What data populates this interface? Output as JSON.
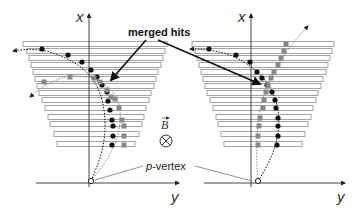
{
  "diagram": {
    "colors": {
      "axis": "#444444",
      "bar_stroke": "#9a9a9a",
      "bar_fill": "#ffffff",
      "hit_black": "#111111",
      "hit_gray": "#888888",
      "arrow": "#111111",
      "leader": "#777777"
    },
    "labels": {
      "merged_hits": "merged hits",
      "p_vertex_italic": "p",
      "p_vertex_rest": "-vertex",
      "b_field": "B",
      "b_field_symbol": "⊗"
    },
    "panels": [
      {
        "name": "left",
        "axis_x_label": "x",
        "axis_y_label": "y",
        "axis_origin": [
          89,
          183
        ],
        "axis_top": 14,
        "axis_right": 179,
        "axis_left": 36,
        "vertex": [
          91,
          181
        ],
        "bars": [
          {
            "y": 44,
            "x1": 23,
            "x2": 167
          },
          {
            "y": 51,
            "x1": 27,
            "x2": 165
          },
          {
            "y": 58,
            "x1": 29,
            "x2": 163
          },
          {
            "y": 65,
            "x1": 31,
            "x2": 161
          },
          {
            "y": 72,
            "x1": 33,
            "x2": 158
          },
          {
            "y": 79,
            "x1": 35,
            "x2": 156
          },
          {
            "y": 86,
            "x1": 37,
            "x2": 154
          },
          {
            "y": 93,
            "x1": 39,
            "x2": 151
          },
          {
            "y": 100,
            "x1": 42,
            "x2": 149
          },
          {
            "y": 108,
            "x1": 45,
            "x2": 146
          },
          {
            "y": 117,
            "x1": 48,
            "x2": 144
          },
          {
            "y": 124,
            "x1": 50,
            "x2": 142
          },
          {
            "y": 134,
            "x1": 54,
            "x2": 139
          },
          {
            "y": 144,
            "x1": 57,
            "x2": 135
          }
        ],
        "tracks": [
          {
            "color": "black",
            "path": "M91,181 C100,160 108,140 104,110 C100,85 90,65 50,52 C40,49 25,49 13,51",
            "hits": [
              [
                42,
                49
              ],
              [
                68,
                55
              ],
              [
                82,
                62
              ],
              [
                91,
                70
              ],
              [
                97,
                77
              ],
              [
                102,
                85
              ],
              [
                107,
                92
              ],
              [
                108,
                101
              ],
              [
                110,
                110
              ],
              [
                112,
                120
              ],
              [
                113,
                126
              ],
              [
                113,
                136
              ],
              [
                112,
                145
              ]
            ]
          },
          {
            "color": "gray",
            "path": "M91,181 C108,160 122,140 120,110 C118,90 100,75 70,76 C50,80 38,90 30,97",
            "hits": [
              [
                44,
                82
              ],
              [
                70,
                77
              ],
              [
                94,
                78
              ],
              [
                100,
                82
              ],
              [
                107,
                90
              ],
              [
                111,
                97
              ],
              [
                115,
                99
              ],
              [
                119,
                108
              ],
              [
                122,
                120
              ],
              [
                124,
                126
              ],
              [
                124,
                136
              ],
              [
                124,
                145
              ]
            ]
          }
        ]
      },
      {
        "name": "right",
        "axis_x_label": "x",
        "axis_y_label": "y",
        "axis_origin": [
          251,
          183
        ],
        "axis_top": 14,
        "axis_right": 345,
        "axis_left": 204,
        "vertex": [
          258,
          181
        ],
        "bars": [
          {
            "y": 44,
            "x1": 192,
            "x2": 334
          },
          {
            "y": 51,
            "x1": 195,
            "x2": 332
          },
          {
            "y": 58,
            "x1": 197,
            "x2": 330
          },
          {
            "y": 65,
            "x1": 199,
            "x2": 328
          },
          {
            "y": 72,
            "x1": 201,
            "x2": 326
          },
          {
            "y": 79,
            "x1": 203,
            "x2": 323
          },
          {
            "y": 86,
            "x1": 205,
            "x2": 321
          },
          {
            "y": 93,
            "x1": 207,
            "x2": 318
          },
          {
            "y": 100,
            "x1": 210,
            "x2": 316
          },
          {
            "y": 108,
            "x1": 213,
            "x2": 313
          },
          {
            "y": 117,
            "x1": 216,
            "x2": 311
          },
          {
            "y": 124,
            "x1": 218,
            "x2": 308
          },
          {
            "y": 134,
            "x1": 221,
            "x2": 305
          },
          {
            "y": 144,
            "x1": 224,
            "x2": 302
          }
        ],
        "tracks": [
          {
            "color": "black",
            "path": "M258,181 C272,160 282,135 278,110 C274,90 264,70 230,55 C215,50 200,49 190,49",
            "hits": [
              [
                209,
                49
              ],
              [
                236,
                55
              ],
              [
                250,
                62
              ],
              [
                257,
                72
              ],
              [
                262,
                78
              ],
              [
                267,
                85
              ],
              [
                272,
                92
              ],
              [
                275,
                100
              ],
              [
                276,
                108
              ],
              [
                278,
                118
              ],
              [
                278,
                126
              ],
              [
                278,
                136
              ],
              [
                277,
                145
              ]
            ]
          },
          {
            "color": "gray",
            "path": "M258,181 C256,160 256,135 260,110 C265,85 280,55 308,26",
            "hits": [
              [
                258,
                145
              ],
              [
                258,
                136
              ],
              [
                259,
                126
              ],
              [
                260,
                118
              ],
              [
                263,
                108
              ],
              [
                264,
                100
              ],
              [
                266,
                92
              ],
              [
                268,
                85
              ],
              [
                271,
                78
              ],
              [
                274,
                72
              ],
              [
                278,
                65
              ],
              [
                281,
                58
              ],
              [
                284,
                51
              ],
              [
                286,
                44
              ]
            ]
          }
        ]
      }
    ],
    "annotations": {
      "merged_hits_text_pos": [
        128,
        36
      ],
      "merged_hits_arrows": [
        {
          "from": [
            146,
            40
          ],
          "to": [
            111,
            80
          ]
        },
        {
          "from": [
            158,
            40
          ],
          "to": [
            260,
            84
          ]
        }
      ],
      "b_field_pos": [
        161,
        129
      ],
      "b_circle_center": [
        166,
        141
      ],
      "p_vertex_text_pos": [
        146,
        170
      ],
      "p_vertex_leaders": [
        {
          "from": [
            143,
            166
          ],
          "to": [
            95,
            180
          ]
        },
        {
          "from": [
            195,
            166
          ],
          "to": [
            252,
            181
          ]
        }
      ]
    }
  }
}
